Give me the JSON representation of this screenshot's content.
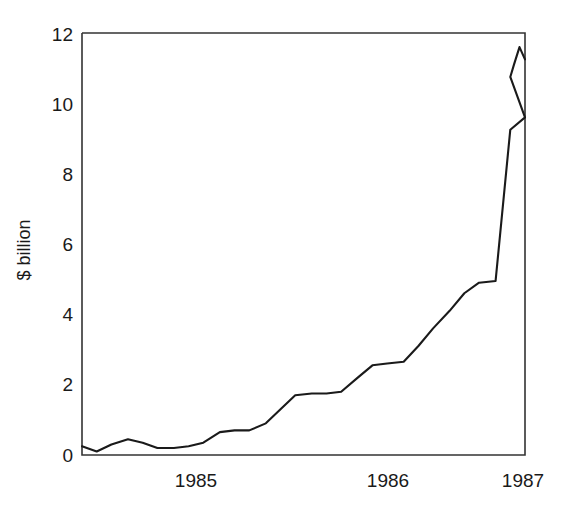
{
  "chart_data": {
    "type": "line",
    "title": "",
    "subtitle": "",
    "xlabel": "",
    "ylabel": "$ billion",
    "xlim": [
      1984.67,
      1987.08
    ],
    "ylim": [
      0,
      12
    ],
    "grid": false,
    "legend": null,
    "y_ticks": [
      0,
      2,
      4,
      6,
      8,
      10,
      12
    ],
    "y_tick_labels": [
      "0",
      "2",
      "4",
      "6",
      "8",
      "10",
      "12"
    ],
    "x_ticks": [
      1985,
      1986,
      1987
    ],
    "x_tick_labels": [
      "1985",
      "1986",
      "1987"
    ],
    "series": [
      {
        "name": "",
        "color": "#1a1a1a",
        "x": [
          1984.67,
          1984.75,
          1984.83,
          1984.92,
          1985.0,
          1985.08,
          1985.17,
          1985.25,
          1985.33,
          1985.42,
          1985.5,
          1985.58,
          1985.67,
          1985.75,
          1985.83,
          1985.92,
          1986.0,
          1986.08,
          1986.17,
          1986.25,
          1986.33,
          1986.42,
          1986.5,
          1986.58,
          1986.67,
          1986.75,
          1986.83,
          1986.92,
          1987.0,
          1987.08
        ],
        "values": [
          0.25,
          0.1,
          0.3,
          0.45,
          0.35,
          0.2,
          0.2,
          0.25,
          0.35,
          0.65,
          0.7,
          0.7,
          0.9,
          1.3,
          1.7,
          1.75,
          1.75,
          1.8,
          2.2,
          2.55,
          2.6,
          2.65,
          3.1,
          3.6,
          4.1,
          4.6,
          4.9,
          4.95,
          9.25,
          9.6
        ]
      }
    ],
    "series_tail": {
      "x": [
        1986.92,
        1987.0,
        1987.02,
        1987.05,
        1987.08
      ],
      "values": [
        9.6,
        10.75,
        11.1,
        11.6,
        11.25
      ]
    }
  },
  "axes": {
    "y_axis_label": "$ billion",
    "x_axis_label": ""
  }
}
